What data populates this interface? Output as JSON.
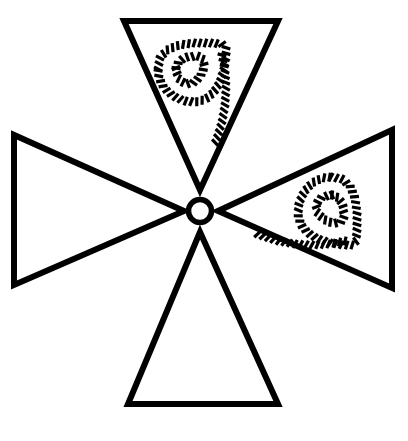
{
  "figure": {
    "canvas": {
      "width": 408,
      "height": 441,
      "background": "#ffffff"
    },
    "stroke_color": "#000000",
    "outline_stroke_width": 6,
    "hub": {
      "name": "center-ring",
      "cx": 200,
      "cy": 211,
      "radius": 11.5,
      "stroke_width": 5.5,
      "fill": "none"
    },
    "triangles": [
      {
        "id": "triangle-top",
        "label": "top-triangle",
        "orientation": "points-down",
        "rotation_deg": 0,
        "points": "124,21 278,21 200,190",
        "apex": [
          200,
          190
        ],
        "base": [
          [
            124,
            21
          ],
          [
            278,
            21
          ]
        ],
        "has_mark": true,
        "mark_rotation_deg": 0
      },
      {
        "id": "triangle-right",
        "label": "right-triangle",
        "orientation": "points-left",
        "rotation_deg": 90,
        "points": "392,130 392,288 218,211",
        "apex": [
          218,
          211
        ],
        "base": [
          [
            392,
            130
          ],
          [
            392,
            288
          ]
        ],
        "has_mark": true,
        "mark_rotation_deg": 90
      },
      {
        "id": "triangle-bottom",
        "label": "bottom-triangle",
        "orientation": "points-up",
        "rotation_deg": 180,
        "points": "128,404 278,404 200,232",
        "apex": [
          200,
          232
        ],
        "base": [
          [
            128,
            404
          ],
          [
            278,
            404
          ]
        ],
        "has_mark": false,
        "mark_rotation_deg": 180
      },
      {
        "id": "triangle-left",
        "label": "left-triangle",
        "orientation": "points-right",
        "rotation_deg": 270,
        "points": "14,135 14,285 184,211",
        "apex": [
          184,
          211
        ],
        "base": [
          [
            14,
            135
          ],
          [
            14,
            285
          ]
        ],
        "has_mark": false,
        "mark_rotation_deg": 270
      }
    ],
    "marks": [
      {
        "id": "mark-top",
        "label": "hatched-loop-glyph-top",
        "description": "hatched stitched outline forming a closed loop with a descending tail, resembling a hand-drawn 9",
        "center": [
          192,
          75
        ],
        "rotation_deg": 0,
        "stitch_color": "#000000",
        "stitch_width": 3.2,
        "stitch_length": 9
      },
      {
        "id": "mark-right",
        "label": "hatched-loop-glyph-right",
        "description": "same hatched stitched loop glyph rotated a quarter turn with the tail pointing down-left",
        "center": [
          325,
          211
        ],
        "rotation_deg": 90,
        "stitch_color": "#000000",
        "stitch_width": 3.2,
        "stitch_length": 9
      }
    ],
    "glyph_path": {
      "loop_outer": [
        [
          -34,
          -6
        ],
        [
          -32,
          -17
        ],
        [
          -25,
          -25
        ],
        [
          -13,
          -30
        ],
        [
          2,
          -32
        ],
        [
          18,
          -32
        ],
        [
          30,
          -31
        ],
        [
          34,
          -28
        ],
        [
          34,
          -18
        ],
        [
          32,
          -6
        ],
        [
          28,
          7
        ],
        [
          22,
          17
        ],
        [
          14,
          24
        ],
        [
          4,
          27
        ],
        [
          -8,
          26
        ],
        [
          -19,
          21
        ],
        [
          -28,
          13
        ],
        [
          -33,
          3
        ],
        [
          -34,
          -6
        ]
      ],
      "loop_inner": [
        [
          -16,
          -7
        ],
        [
          -13,
          -14
        ],
        [
          -5,
          -18
        ],
        [
          6,
          -19
        ],
        [
          12,
          -15
        ],
        [
          12,
          -7
        ],
        [
          8,
          2
        ],
        [
          1,
          8
        ],
        [
          -7,
          9
        ],
        [
          -14,
          3
        ],
        [
          -16,
          -7
        ]
      ],
      "tail": [
        [
          30,
          -20
        ],
        [
          33,
          -5
        ],
        [
          34,
          12
        ],
        [
          33,
          30
        ],
        [
          30,
          47
        ],
        [
          26,
          60
        ],
        [
          23,
          68
        ]
      ]
    }
  }
}
